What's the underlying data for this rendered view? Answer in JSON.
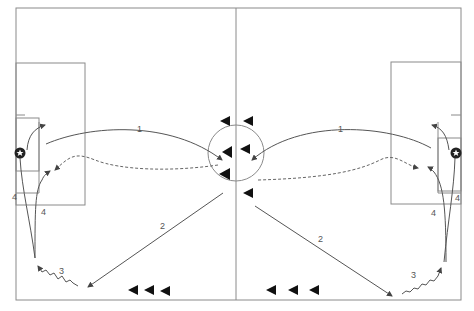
{
  "diagram": {
    "type": "soccer-drill",
    "colors": {
      "field_line": "#8a8a8a",
      "run_line": "#555555",
      "dribble_line": "#555555",
      "player": "#111111",
      "background": "#ffffff"
    },
    "labels": {
      "left_pass1": "1",
      "right_pass1": "1",
      "left_pass2": "2",
      "right_pass2": "2",
      "left_dribble": "3",
      "right_dribble": "3",
      "left_shot_a": "4",
      "left_shot_b": "4",
      "right_shot_a": "4",
      "right_shot_b": "4"
    },
    "icons": {
      "ball": "soccer-ball-icon",
      "player": "player-triangle-icon"
    },
    "legend_semantics": {
      "solid_line": "pass / shot",
      "dashed_line": "player run",
      "zigzag_line": "dribble"
    }
  }
}
